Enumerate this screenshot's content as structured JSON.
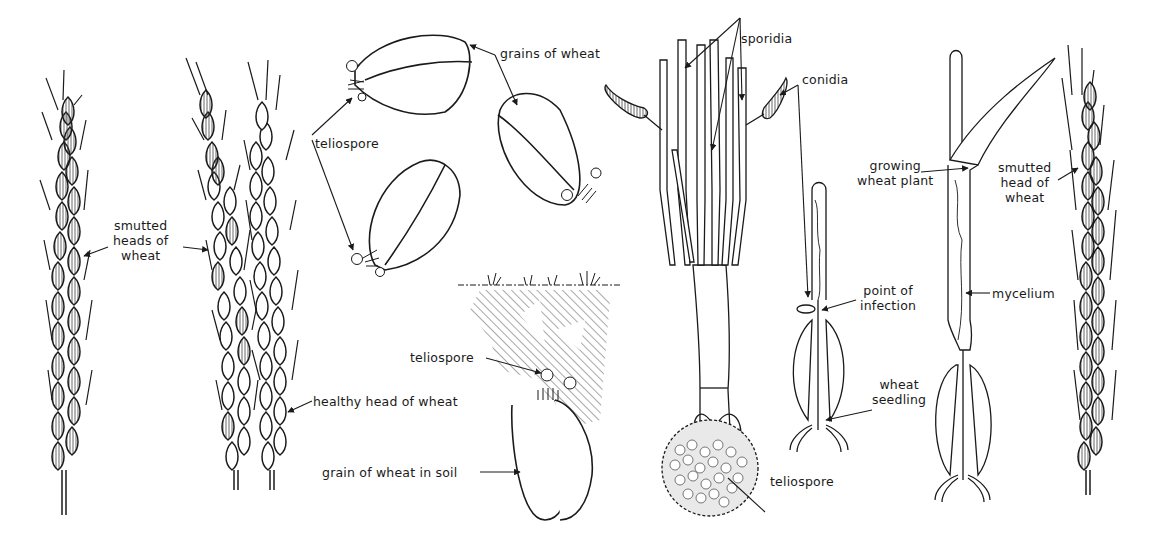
{
  "figure": {
    "ink_color": "#1a1a1a",
    "background": "#ffffff",
    "labels": {
      "smutted_heads": "smutted\nheads of\nwheat",
      "healthy_head": "healthy head of wheat",
      "grains_of_wheat": "grains of wheat",
      "teliospore_top": "teliospore",
      "teliospore_soil": "teliospore",
      "grain_in_soil": "grain of wheat in soil",
      "sporidia": "sporidia",
      "conidia": "conidia",
      "teliospore_bottom": "teliospore",
      "point_of_infection": "point of\ninfection",
      "wheat_seedling": "wheat\nseedling",
      "growing_wheat_plant": "growing\nwheat plant",
      "mycelium": "mycelium",
      "smutted_head_right": "smutted\nhead of\nwheat"
    },
    "panels": [
      {
        "id": "smutted-head-left",
        "kind": "smutted-wheat-head"
      },
      {
        "id": "smutted-head-center",
        "kind": "smutted-wheat-head"
      },
      {
        "id": "healthy-head",
        "kind": "healthy-wheat-head"
      },
      {
        "id": "grains-with-teliospores",
        "kind": "grains",
        "count": 3
      },
      {
        "id": "grain-in-soil",
        "kind": "grain-in-soil"
      },
      {
        "id": "germinating-teliospore",
        "kind": "teliospore-germination"
      },
      {
        "id": "wheat-seedling",
        "kind": "seedling"
      },
      {
        "id": "growing-plant",
        "kind": "growing-plant"
      },
      {
        "id": "smutted-head-right",
        "kind": "smutted-wheat-head"
      }
    ]
  }
}
